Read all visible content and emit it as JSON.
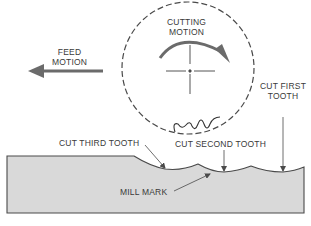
{
  "labels": {
    "feed_motion": [
      "FEED",
      "MOTION"
    ],
    "cutting_motion": [
      "CUTTING",
      "MOTION"
    ],
    "cut_first_tooth": [
      "CUT FIRST",
      "TOOTH"
    ],
    "cut_second_tooth": "CUT SECOND TOOTH",
    "cut_third_tooth": "CUT THIRD TOOTH",
    "mill_mark": "MILL MARK"
  },
  "colors": {
    "workpiece_fill": "#d9d9d9",
    "stroke": "#4a4a4a",
    "arrow": "#6b6b6b",
    "text": "#3a3a3a"
  }
}
